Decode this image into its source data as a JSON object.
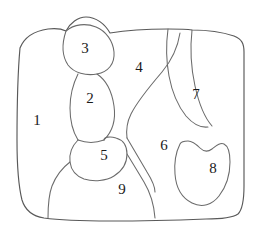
{
  "figure": {
    "canvas": {
      "width": 260,
      "height": 237
    },
    "background_color": "#ffffff",
    "line_color": "#595959",
    "divider_color": "#6b6b6b",
    "label_color": "#1a1a1a"
  },
  "regions": [
    {
      "id": "region-1",
      "label": "1",
      "x": 37,
      "y": 122
    },
    {
      "id": "region-2",
      "label": "2",
      "x": 90,
      "y": 100
    },
    {
      "id": "region-3",
      "label": "3",
      "x": 85,
      "y": 50
    },
    {
      "id": "region-4",
      "label": "4",
      "x": 139,
      "y": 69
    },
    {
      "id": "region-5",
      "label": "5",
      "x": 104,
      "y": 157
    },
    {
      "id": "region-6",
      "label": "6",
      "x": 164,
      "y": 147
    },
    {
      "id": "region-7",
      "label": "7",
      "x": 196,
      "y": 96
    },
    {
      "id": "region-8",
      "label": "8",
      "x": 213,
      "y": 170
    },
    {
      "id": "region-9",
      "label": "9",
      "x": 122,
      "y": 191
    }
  ],
  "paths": {
    "outer_boundary": "M 20 48 C 24 38 34 31 48 29 C 56 28 62 29 66 31 C 70 23 78 17 86 17 C 96 17 105 24 110 33 C 128 30 150 29 168 29 C 178 29 186 29 192 30 C 206 30 222 32 234 36 C 242 39 244 44 244 52 L 244 186 C 244 200 242 210 238 214 C 232 218 220 219 206 219 C 180 220 140 221 110 221 C 84 221 58 220 44 218 C 32 216 25 210 22 200 C 19 188 17 168 17 140 C 17 110 18 70 20 48 Z",
    "edge_3_left": "M 66 31 C 64 40 63 50 64 58 C 65 66 70 72 78 74",
    "region_3_blob": "M 66 31 C 62 43 62 56 68 65 C 74 73 86 76 97 74 C 108 72 115 64 114 52 C 113 41 106 31 96 27 C 86 23 74 24 66 31 Z",
    "edge_2_left": "M 78 74 C 73 84 70 96 70 108 C 70 122 73 132 78 140",
    "edge_2_right": "M 97 74 C 106 80 112 92 114 106 C 116 120 112 132 104 140",
    "edge_2_bottom": "M 78 140 C 86 143 96 143 104 140",
    "edge_4_6": "M 180 33 C 178 46 172 60 162 72 C 150 86 138 100 131 114 C 127 122 126 130 127 138",
    "edge_5_top": "M 78 140 C 80 142 82 143 84 144",
    "region_5": "M 78 140 C 72 146 69 154 70 162 C 71 170 76 176 84 179 C 94 182 106 181 114 176 C 122 171 127 163 127 154 C 127 146 123 140 116 138 C 110 136 104 137 104 140",
    "edge_9_left": "M 70 162 C 62 168 56 176 52 186 C 49 194 48 206 48 218",
    "edge_9_right": "M 127 154 C 132 162 138 172 144 182 C 150 192 154 204 155 218",
    "edge_6_bottom_hook": "M 127 138 C 133 148 140 160 147 172 C 152 180 155 186 155 192",
    "edge_7_left": "M 168 29 C 166 44 166 60 169 76 C 172 92 178 106 186 116 C 193 124 200 128 208 127",
    "edge_7_right": "M 192 30 C 190 48 191 68 195 86 C 199 104 205 118 212 126",
    "region_8": "M 180 144 C 176 152 174 162 175 174 C 176 188 182 198 192 203 C 202 208 212 205 219 196 C 226 187 230 174 230 162 C 230 152 228 146 224 144 C 220 142 216 146 212 149 C 208 152 204 152 200 148 C 196 144 192 141 188 141 C 184 141 181 142 180 144 Z",
    "edge_8_hook_top": "M 180 144 C 184 140 190 139 196 143 C 202 147 208 150 214 147 C 220 144 226 142 230 146"
  }
}
